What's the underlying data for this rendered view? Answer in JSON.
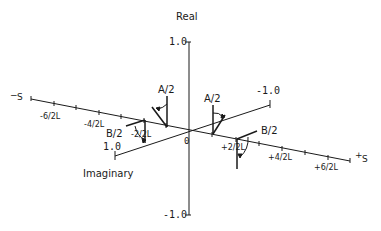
{
  "diagram": {
    "type": "3d-axes-phasor-diagram",
    "axes": {
      "real": {
        "label": "Real",
        "max_label": "1.0",
        "min_label": "-1.0"
      },
      "imaginary": {
        "label": "Imaginary",
        "near_end_label": "1.0",
        "far_end_label": "-1.0"
      },
      "s": {
        "neg_label": "S",
        "neg_sign": "−",
        "pos_label": "S",
        "pos_sign": "+"
      }
    },
    "origin_label": "0",
    "s_ticks": {
      "neg6": "-6/2L",
      "neg4": "-4/2L",
      "neg2": "-2/2L",
      "pos2": "+2/2L",
      "pos4": "+4/2L",
      "pos6": "+6/2L"
    },
    "phasors": [
      {
        "id": "A-left",
        "label": "A/2"
      },
      {
        "id": "A-right",
        "label": "A/2"
      },
      {
        "id": "B-left",
        "label": "B/2"
      },
      {
        "id": "B-right",
        "label": "B/2"
      }
    ],
    "colors": {
      "line": "#1a1a1a",
      "background": "#ffffff"
    }
  }
}
